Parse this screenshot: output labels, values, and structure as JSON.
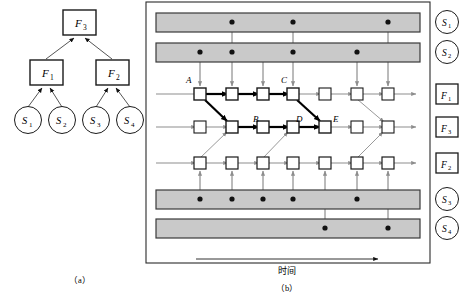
{
  "figure": {
    "panel_a": {
      "caption": "（a）",
      "nodes": [
        {
          "id": "F3",
          "label": "F",
          "sub": "3",
          "shape": "rect",
          "x": 79,
          "y": 143
        },
        {
          "id": "F1",
          "label": "F",
          "sub": "1",
          "shape": "rect",
          "x": 46,
          "y": 189
        },
        {
          "id": "F2",
          "label": "F",
          "sub": "2",
          "shape": "rect",
          "x": 112,
          "y": 189
        },
        {
          "id": "S1",
          "label": "S",
          "sub": "1",
          "shape": "circle",
          "x": 28,
          "y": 238
        },
        {
          "id": "S2",
          "label": "S",
          "sub": "2",
          "shape": "circle",
          "x": 62,
          "y": 238
        },
        {
          "id": "S3",
          "label": "S",
          "sub": "3",
          "shape": "circle",
          "x": 96,
          "y": 238
        },
        {
          "id": "S4",
          "label": "S",
          "sub": "4",
          "shape": "circle",
          "x": 130,
          "y": 238
        }
      ],
      "edges": [
        {
          "from": "F1",
          "to": "F3"
        },
        {
          "from": "F2",
          "to": "F3"
        },
        {
          "from": "S1",
          "to": "F1"
        },
        {
          "from": "S2",
          "to": "F1"
        },
        {
          "from": "S3",
          "to": "F1"
        },
        {
          "from": "S4",
          "to": "F2"
        }
      ]
    },
    "panel_b": {
      "caption": "（b）",
      "time_axis_label": "时间",
      "legend": [
        {
          "id": "S1",
          "label": "S",
          "sub": "1",
          "shape": "circle",
          "y": 22
        },
        {
          "id": "S2",
          "label": "S",
          "sub": "2",
          "shape": "circle",
          "y": 52
        },
        {
          "id": "F1",
          "label": "F",
          "sub": "1",
          "shape": "rect",
          "y": 94
        },
        {
          "id": "F3",
          "label": "F",
          "sub": "3",
          "shape": "rect",
          "y": 127
        },
        {
          "id": "F2",
          "label": "F",
          "sub": "2",
          "shape": "rect",
          "y": 163
        },
        {
          "id": "S3",
          "label": "S",
          "sub": "3",
          "shape": "circle",
          "y": 199
        },
        {
          "id": "S4",
          "label": "S",
          "sub": "4",
          "shape": "circle",
          "y": 228
        }
      ],
      "sensor_bars": [
        {
          "id": "S1",
          "y": 13,
          "height": 19,
          "dots_x": [
            232,
            293,
            388
          ]
        },
        {
          "id": "S2",
          "y": 43,
          "height": 19,
          "dots_x": [
            200,
            232,
            293,
            357
          ]
        },
        {
          "id": "S3",
          "y": 190,
          "height": 19,
          "dots_x": [
            200,
            232,
            263,
            293,
            357
          ]
        },
        {
          "id": "S4",
          "y": 219,
          "height": 19,
          "dots_x": [
            325,
            388
          ]
        }
      ],
      "fusion_rows": [
        {
          "id": "F1",
          "y": 94,
          "nodes_x": [
            200,
            232,
            263,
            293,
            325,
            357,
            388
          ]
        },
        {
          "id": "F3",
          "y": 127,
          "nodes_x": [
            200,
            232,
            263,
            293,
            325,
            357,
            388
          ]
        },
        {
          "id": "F2",
          "y": 163,
          "nodes_x": [
            200,
            232,
            263,
            293,
            325,
            357,
            388
          ]
        }
      ],
      "node_labels": [
        {
          "text": "A",
          "x": 189,
          "y": 80
        },
        {
          "text": "B",
          "x": 256,
          "y": 117
        },
        {
          "text": "C",
          "x": 283,
          "y": 80
        },
        {
          "text": "D",
          "x": 299,
          "y": 117
        },
        {
          "text": "E",
          "x": 331,
          "y": 117
        }
      ],
      "highlighted_path": [
        "A",
        "F1-2",
        "F1-3",
        "C",
        "E",
        "D",
        "B"
      ],
      "colors": {
        "bar_fill": "#c9c9c9",
        "bar_stroke": "#3a3a3a",
        "line_light": "#9a9a9a",
        "line_dark": "#000000",
        "node_fill": "#ffffff",
        "node_stroke": "#1a1a1a"
      }
    }
  }
}
